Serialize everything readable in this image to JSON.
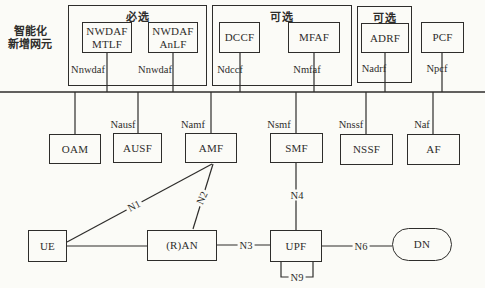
{
  "figure": {
    "description_label": "智能化\n新增网元"
  },
  "groups": [
    {
      "title": "必选"
    },
    {
      "title": "可选"
    },
    {
      "title": "可选"
    }
  ],
  "nodes": {
    "nwdaf_mtlf": "NWDAF\nMTLF",
    "nwdaf_anlf": "NWDAF\nAnLF",
    "dccf": "DCCF",
    "mfaf": "MFAF",
    "adrf": "ADRF",
    "pcf": "PCF",
    "oam": "OAM",
    "ausf": "AUSF",
    "amf": "AMF",
    "smf": "SMF",
    "nssf": "NSSF",
    "af": "AF",
    "ue": "UE",
    "ran": "(R)AN",
    "upf": "UPF",
    "dn": "DN"
  },
  "interfaces": {
    "nnwdaf_mtlf": "Nnwdaf",
    "nnwdaf_anlf": "Nnwdaf",
    "ndccf": "Ndccf",
    "nmfaf": "Nmfaf",
    "nadrf": "Nadrf",
    "npcf": "Npcf",
    "nausf": "Nausf",
    "namf": "Namf",
    "nsmf": "Nsmf",
    "nnssf": "Nnssf",
    "naf": "Naf"
  },
  "reference_points": {
    "n1": "N1",
    "n2": "N2",
    "n3": "N3",
    "n4": "N4",
    "n6": "N6",
    "n9": "N9"
  },
  "colors": {
    "ink": "#2e2d2b",
    "background": "#fbfbf7"
  }
}
